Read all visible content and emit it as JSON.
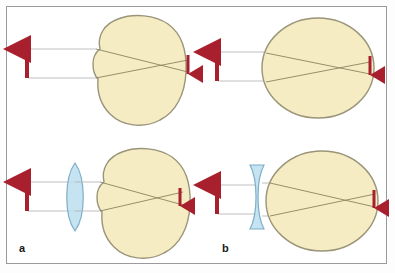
{
  "figure": {
    "background_color": "#ffffff",
    "frame_color": "#9a9a9a",
    "width": 395,
    "height": 273
  },
  "colors": {
    "eye_fill": "#f5ecc4",
    "eye_outline": "#9a9478",
    "lens_fill": "#bfe0f0",
    "lens_outline": "#6fa6c4",
    "ray_line": "#8a8460",
    "object_ray": "#b0b0b0",
    "arrow_red": "#a81f2e",
    "label_text": "#1a1a1a"
  },
  "labels": {
    "panel_a": "a",
    "panel_b": "b"
  },
  "panels": [
    {
      "id": "panel-a-top",
      "letter": "a",
      "row": "top",
      "condition": "hyperopia-uncorrected",
      "eye_shape": "tall-oval-short-axial-length",
      "corrective_lens": "none",
      "object_arrow": "up",
      "image_arrow": "down",
      "focus_location": "behind-retina"
    },
    {
      "id": "panel-a-bottom",
      "letter": "a",
      "row": "bottom",
      "condition": "hyperopia-corrected",
      "eye_shape": "tall-oval-short-axial-length",
      "corrective_lens": "convex",
      "object_arrow": "up",
      "image_arrow": "down",
      "focus_location": "on-retina"
    },
    {
      "id": "panel-b-top",
      "letter": "b",
      "row": "top",
      "condition": "myopia-uncorrected",
      "eye_shape": "round-long-axial-length",
      "corrective_lens": "none",
      "object_arrow": "up",
      "image_arrow": "down",
      "focus_location": "in-front-of-retina"
    },
    {
      "id": "panel-b-bottom",
      "letter": "b",
      "row": "bottom",
      "condition": "myopia-corrected",
      "eye_shape": "round-long-axial-length",
      "corrective_lens": "concave",
      "object_arrow": "up",
      "image_arrow": "down",
      "focus_location": "on-retina"
    }
  ]
}
